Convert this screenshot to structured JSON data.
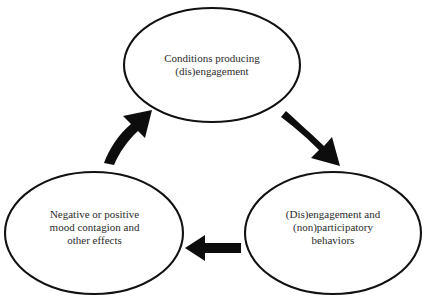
{
  "diagram": {
    "type": "cyclical-process",
    "direction": "clockwise",
    "background_color": "#ffffff",
    "stroke_color": "#111111",
    "text_color": "#2b2b2b",
    "nodes": [
      {
        "id": "top",
        "name": "conditions-node",
        "label": "Conditions producing\n(dis)engagement",
        "lines": [
          "Conditions producing",
          "(dis)engagement"
        ]
      },
      {
        "id": "right",
        "name": "engagement-behaviors-node",
        "label": "(Dis)engagement and\n(non)participatory\nbehaviors",
        "lines": [
          "(Dis)engagement and",
          "(non)participatory",
          "behaviors"
        ]
      },
      {
        "id": "left",
        "name": "mood-contagion-node",
        "label": "Negative or positive\nmood contagion and\nother effects",
        "lines": [
          "Negative or positive",
          "mood contagion and",
          "other effects"
        ]
      }
    ],
    "arrows": [
      {
        "id": "top-to-right",
        "name": "arrow-top-to-right",
        "from": "top",
        "to": "right",
        "style": "curved",
        "shape": "thick-curved-arrow"
      },
      {
        "id": "right-to-left",
        "name": "arrow-right-to-left",
        "from": "right",
        "to": "left",
        "style": "straight",
        "shape": "thick-straight-arrow"
      },
      {
        "id": "left-to-top",
        "name": "arrow-left-to-top",
        "from": "left",
        "to": "top",
        "style": "curved",
        "shape": "thick-curved-arrow"
      }
    ]
  }
}
